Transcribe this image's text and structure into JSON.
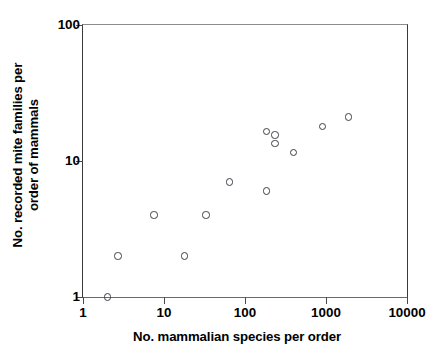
{
  "chart_data": {
    "type": "scatter",
    "title": "",
    "xlabel": "No. mammalian species per order",
    "ylabel_line1": "No. recorded mite families per",
    "ylabel_line2": "order of mammals",
    "ylabel": "No. recorded mite families per order of mammals",
    "xscale": "log",
    "yscale": "log",
    "xlim": [
      1,
      10000
    ],
    "ylim": [
      1,
      100
    ],
    "grid": false,
    "legend": null,
    "xticks": [
      1,
      10,
      100,
      1000,
      10000
    ],
    "xtick_labels": [
      "1",
      "10",
      "100",
      "1000",
      "10000"
    ],
    "yticks": [
      1,
      10,
      100
    ],
    "ytick_labels": [
      "1",
      "10",
      "100"
    ],
    "marker": "open-circle",
    "marker_color": "#3d3d46",
    "points": [
      {
        "x": 2,
        "y": 1
      },
      {
        "x": 2.7,
        "y": 2
      },
      {
        "x": 7.5,
        "y": 4
      },
      {
        "x": 18,
        "y": 2
      },
      {
        "x": 33,
        "y": 4
      },
      {
        "x": 64,
        "y": 7
      },
      {
        "x": 185,
        "y": 6
      },
      {
        "x": 185,
        "y": 16.5
      },
      {
        "x": 235,
        "y": 15.5
      },
      {
        "x": 235,
        "y": 13.5
      },
      {
        "x": 400,
        "y": 11.5
      },
      {
        "x": 900,
        "y": 18
      },
      {
        "x": 1900,
        "y": 21
      }
    ]
  }
}
